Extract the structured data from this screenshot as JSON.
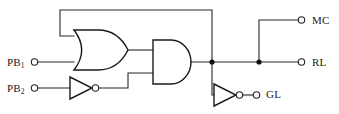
{
  "diagram": {
    "background_color": "#ffffff",
    "line_color": "#262626",
    "gate_fill": "#ffffff"
  },
  "inputs": [
    {
      "id": "pb1",
      "label": "PB",
      "subscript": "1",
      "terminal": "open-circle",
      "x": 33,
      "y": 62
    },
    {
      "id": "pb2",
      "label": "PB",
      "subscript": "2",
      "terminal": "open-circle",
      "x": 33,
      "y": 88
    }
  ],
  "outputs": [
    {
      "id": "mc",
      "label": "MC",
      "terminal": "open-circle",
      "x": 303,
      "y": 20
    },
    {
      "id": "rl",
      "label": "RL",
      "terminal": "open-circle",
      "x": 303,
      "y": 62
    },
    {
      "id": "gl",
      "label": "GL",
      "terminal": "open-circle",
      "x": 257,
      "y": 94
    }
  ],
  "gates": [
    {
      "id": "or1",
      "type": "OR",
      "inputs": [
        "feedback",
        "pb1"
      ],
      "output": "or-out"
    },
    {
      "id": "not1",
      "type": "NOT",
      "inputs": [
        "pb2"
      ],
      "output": "not1-out"
    },
    {
      "id": "and1",
      "type": "AND",
      "inputs": [
        "or-out",
        "not1-out"
      ],
      "output": "and-out"
    },
    {
      "id": "not2",
      "type": "NOT",
      "inputs": [
        "and-out"
      ],
      "output": "gl"
    }
  ],
  "nets": [
    {
      "id": "feedback",
      "from": "and-out",
      "to": "or1.in1",
      "note": "latch feedback from AND output back to OR upper input"
    },
    {
      "id": "and-out",
      "from": "and1",
      "to": "rl",
      "note": "drives RL, MC branch and GL inverter"
    }
  ],
  "junctions": [
    {
      "x": 212,
      "y": 62
    },
    {
      "x": 259,
      "y": 62
    }
  ],
  "labels": {
    "pb1": "PB",
    "pb1_sub": "1",
    "pb2": "PB",
    "pb2_sub": "2",
    "mc": "MC",
    "rl": "RL",
    "gl": "GL"
  }
}
